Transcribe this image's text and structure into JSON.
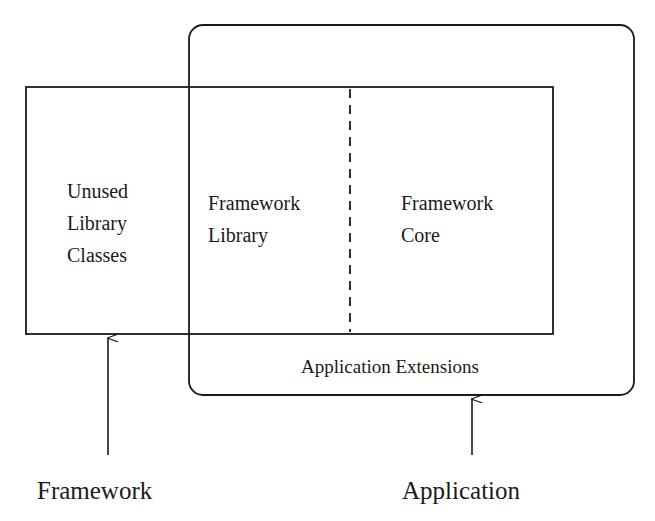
{
  "diagram": {
    "type": "framework-application-overlap",
    "outer_box": {
      "label": "Application Extensions",
      "shape": "rounded-rectangle"
    },
    "inner_box": {
      "regions": [
        {
          "id": "unused",
          "lines": [
            "Unused",
            "Library",
            "Classes"
          ]
        },
        {
          "id": "library",
          "lines": [
            "Framework",
            "Library"
          ]
        },
        {
          "id": "core",
          "lines": [
            "Framework",
            "Core"
          ]
        }
      ],
      "divider_style": "dashed"
    },
    "pointers": [
      {
        "label": "Framework",
        "target": "inner_box"
      },
      {
        "label": "Application",
        "target": "outer_box"
      }
    ]
  },
  "colors": {
    "stroke": "#1a1a1a",
    "background": "#ffffff"
  }
}
